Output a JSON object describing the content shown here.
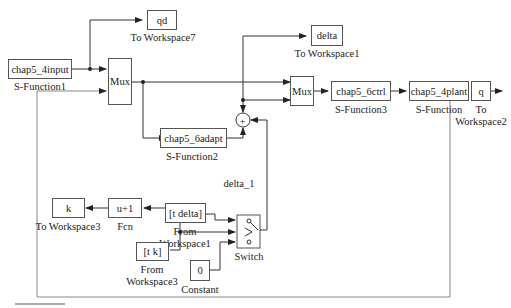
{
  "diagram": {
    "type": "simulink-block-diagram",
    "blocks": {
      "input": {
        "text": "chap5_4input",
        "label": "S-Function1"
      },
      "qd": {
        "text": "qd",
        "label": "To Workspace7"
      },
      "mux1": {
        "text": "Mux"
      },
      "delta_ws": {
        "text": "delta",
        "label": "To Workspace1"
      },
      "mux2": {
        "text": "Mux"
      },
      "ctrl": {
        "text": "chap5_6ctrl",
        "label": "S-Function3"
      },
      "plant": {
        "text": "chap5_4plant",
        "label": "S-Function"
      },
      "q": {
        "text": "q",
        "label1": "To",
        "label2": "Workspace2"
      },
      "adapt": {
        "text": "chap5_6adapt",
        "label": "S-Function2"
      },
      "sum": {
        "text": "+",
        "signal_label": "delta_1"
      },
      "from_delta": {
        "text": "[t delta]",
        "label1": "From",
        "label2": "Workspace1"
      },
      "k": {
        "text": "k",
        "label": "To Workspace3"
      },
      "fcn": {
        "text": "u+1",
        "label": "Fcn"
      },
      "from_k": {
        "text": "[t k]",
        "label1": "From",
        "label2": "Workspace3"
      },
      "constant": {
        "text": "0",
        "label": "Constant"
      },
      "switch": {
        "label": "Switch"
      }
    },
    "colors": {
      "line": "#333333",
      "block_border": "#555555",
      "feedback_line": "#888888"
    }
  }
}
